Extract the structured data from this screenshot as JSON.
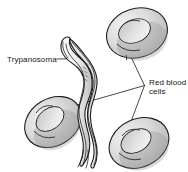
{
  "figure": {
    "width": 188,
    "height": 172,
    "background_color": "#ffffff",
    "type": "scientific-illustration"
  },
  "labels": {
    "trypanosoma": {
      "text": "Trypanosoma",
      "x": 7,
      "y": 62,
      "anchor": "start"
    },
    "red_blood_cells_line1": {
      "text": "Red blood",
      "x": 149,
      "y": 85,
      "anchor": "start"
    },
    "red_blood_cells_line2": {
      "text": "cells",
      "x": 149,
      "y": 94,
      "anchor": "start"
    }
  },
  "leader_lines": {
    "trypanosoma": "M 57 59 L 84 59",
    "rbc_hub_x": 145,
    "rbc_hub_y": 86,
    "to_top_cell": "M 145 86 L 126 44",
    "to_left_cell": "M 145 86 L 57 110",
    "to_bottom_cell": "M 145 86 L 128 131"
  },
  "colors": {
    "outline": "#1c1c1c",
    "cell_fill": "#d9d9d9",
    "cell_highlight": "#f0f0f0",
    "cell_shadow": "#9a9a9a",
    "organism_fill": "#efefef",
    "organism_shadow": "#b5b5b5",
    "text": "#141414",
    "background": "#ffffff"
  },
  "organism": {
    "name": "Trypanosoma",
    "description": "Elongated wavy flagellate protozoan with undulating membrane and posterior flagellum",
    "count": 1
  },
  "red_blood_cells": {
    "name": "Red blood cells",
    "description": "Biconcave disc-shaped erythrocytes shown as shaded toroids",
    "count": 3,
    "positions": [
      {
        "id": "top-right",
        "cx": 137,
        "cy": 33
      },
      {
        "id": "left",
        "cx": 53,
        "cy": 122
      },
      {
        "id": "bottom-right",
        "cx": 139,
        "cy": 143
      }
    ]
  }
}
